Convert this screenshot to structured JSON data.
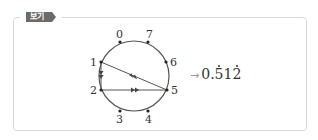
{
  "badge": {
    "label": "보기"
  },
  "diagram": {
    "circle": {
      "cx": 134,
      "cy": 76,
      "r": 35
    },
    "points": [
      {
        "label": "0",
        "x": 120,
        "y": 42
      },
      {
        "label": "7",
        "x": 148,
        "y": 42
      },
      {
        "label": "6",
        "x": 166,
        "y": 62
      },
      {
        "label": "5",
        "x": 167,
        "y": 90
      },
      {
        "label": "4",
        "x": 148,
        "y": 111
      },
      {
        "label": "3",
        "x": 120,
        "y": 111
      },
      {
        "label": "2",
        "x": 101,
        "y": 90
      },
      {
        "label": "1",
        "x": 101,
        "y": 62
      }
    ],
    "edges": [
      {
        "from": "1",
        "to": "2"
      },
      {
        "from": "2",
        "to": "5"
      },
      {
        "from": "5",
        "to": "1"
      }
    ],
    "labels": {
      "p0": "0",
      "p7": "7",
      "p6": "6",
      "p5": "5",
      "p4": "4",
      "p3": "3",
      "p2": "2",
      "p1": "1"
    }
  },
  "result": {
    "arrow": "→",
    "integer_part": "0.",
    "d1": "5",
    "d2": "1",
    "d3": "2",
    "value": "0.512 (512 repeating)"
  }
}
